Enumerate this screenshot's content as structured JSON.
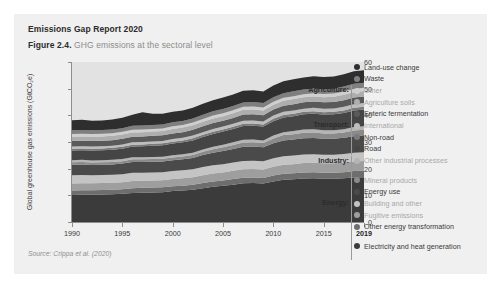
{
  "header": {
    "title": "Emissions Gap Report 2020",
    "figure_number": "Figure 2.4.",
    "caption": "GHG emissions at the sectoral level"
  },
  "source": "Source: Crippa et al. (2020)",
  "chart_data": {
    "type": "area",
    "title": "GHG emissions at the sectoral level",
    "xlabel": "",
    "ylabel": "Global greenhouse gas emissions (GtCO₂e)",
    "ylim": [
      0,
      60
    ],
    "xlim": [
      1990,
      2019
    ],
    "grid": false,
    "stacked": true,
    "legend_position": "right",
    "yticks": [
      "0",
      "10",
      "20",
      "30",
      "40",
      "50",
      "60"
    ],
    "xticks": [
      "1990",
      "1995",
      "2000",
      "2005",
      "2010",
      "2015",
      "2019"
    ],
    "xtick_emphasis": "2019",
    "x": [
      1990,
      1991,
      1992,
      1993,
      1994,
      1995,
      1996,
      1997,
      1998,
      1999,
      2000,
      2001,
      2002,
      2003,
      2004,
      2005,
      2006,
      2007,
      2008,
      2009,
      2010,
      2011,
      2012,
      2013,
      2014,
      2015,
      2016,
      2017,
      2018,
      2019
    ],
    "sectors": [
      {
        "name": "Energy",
        "series": [
          "Electricity and heat generation",
          "Other energy transformation",
          "Fugitive emissions",
          "Building and other"
        ]
      },
      {
        "name": "Industry",
        "series": [
          "Energy use",
          "Mineral products",
          "Other industrial processes"
        ]
      },
      {
        "name": "Transport",
        "series": [
          "Road",
          "Non-road",
          "International"
        ]
      },
      {
        "name": "Agriculture",
        "series": [
          "Enteric fermentation",
          "Agriculture soils",
          "Other"
        ]
      },
      {
        "name": "",
        "series": [
          "Waste",
          "Land-use change"
        ]
      }
    ],
    "series": [
      {
        "name": "Electricity and heat generation",
        "color": "#3b3b3b",
        "values": [
          10.1,
          10.2,
          10.2,
          10.3,
          10.4,
          10.6,
          10.9,
          11.0,
          11.1,
          11.2,
          11.6,
          11.8,
          12.1,
          12.7,
          13.2,
          13.6,
          14.0,
          14.5,
          14.6,
          14.4,
          15.2,
          15.8,
          16.0,
          16.3,
          16.4,
          16.2,
          16.2,
          16.4,
          16.7,
          16.8
        ]
      },
      {
        "name": "Other energy transformation",
        "color": "#6e6e6e",
        "values": [
          1.7,
          1.7,
          1.7,
          1.7,
          1.7,
          1.7,
          1.8,
          1.8,
          1.8,
          1.8,
          1.8,
          1.8,
          1.9,
          1.9,
          2.0,
          2.0,
          2.1,
          2.1,
          2.1,
          2.1,
          2.2,
          2.3,
          2.3,
          2.3,
          2.3,
          2.3,
          2.3,
          2.3,
          2.4,
          2.4
        ]
      },
      {
        "name": "Fugitive emissions",
        "color": "#9e9e9e",
        "values": [
          2.6,
          2.6,
          2.6,
          2.6,
          2.6,
          2.6,
          2.7,
          2.7,
          2.7,
          2.7,
          2.7,
          2.8,
          2.8,
          2.9,
          3.0,
          3.0,
          3.1,
          3.2,
          3.2,
          3.2,
          3.3,
          3.4,
          3.4,
          3.5,
          3.5,
          3.5,
          3.5,
          3.6,
          3.6,
          3.7
        ]
      },
      {
        "name": "Building and other",
        "color": "#c4c4c4",
        "values": [
          3.1,
          3.1,
          3.0,
          3.0,
          3.0,
          3.0,
          3.1,
          3.0,
          3.0,
          3.0,
          3.0,
          3.0,
          3.0,
          3.1,
          3.1,
          3.1,
          3.1,
          3.1,
          3.1,
          3.1,
          3.2,
          3.2,
          3.2,
          3.2,
          3.2,
          3.2,
          3.2,
          3.2,
          3.3,
          3.3
        ]
      },
      {
        "name": "Energy use",
        "color": "#4a4a4a",
        "values": [
          4.0,
          4.0,
          3.9,
          3.9,
          3.9,
          4.0,
          4.0,
          4.0,
          4.0,
          4.0,
          4.1,
          4.1,
          4.2,
          4.5,
          4.7,
          4.9,
          5.1,
          5.3,
          5.3,
          5.2,
          5.6,
          5.9,
          6.0,
          6.1,
          6.1,
          6.0,
          6.0,
          6.1,
          6.2,
          6.3
        ]
      },
      {
        "name": "Mineral products",
        "color": "#8a8a8a",
        "values": [
          0.9,
          0.9,
          0.9,
          0.9,
          0.9,
          0.9,
          1.0,
          1.0,
          1.0,
          1.0,
          1.0,
          1.1,
          1.1,
          1.2,
          1.3,
          1.4,
          1.5,
          1.6,
          1.6,
          1.6,
          1.8,
          2.0,
          2.0,
          2.1,
          2.1,
          2.0,
          2.0,
          2.0,
          2.1,
          2.1
        ]
      },
      {
        "name": "Other industrial processes",
        "color": "#b5b5b5",
        "values": [
          0.8,
          0.8,
          0.8,
          0.8,
          0.8,
          0.8,
          0.8,
          0.8,
          0.8,
          0.8,
          0.8,
          0.8,
          0.9,
          0.9,
          0.9,
          1.0,
          1.0,
          1.0,
          1.0,
          1.0,
          1.1,
          1.1,
          1.2,
          1.2,
          1.2,
          1.2,
          1.2,
          1.2,
          1.3,
          1.3
        ]
      },
      {
        "name": "Road",
        "color": "#454545",
        "values": [
          3.6,
          3.6,
          3.7,
          3.7,
          3.8,
          3.9,
          4.0,
          4.1,
          4.2,
          4.3,
          4.4,
          4.5,
          4.6,
          4.7,
          4.8,
          4.9,
          5.0,
          5.2,
          5.2,
          5.2,
          5.4,
          5.5,
          5.6,
          5.7,
          5.8,
          5.9,
          6.0,
          6.1,
          6.2,
          6.3
        ]
      },
      {
        "name": "Non-road",
        "color": "#7a7a7a",
        "values": [
          0.7,
          0.7,
          0.7,
          0.7,
          0.7,
          0.7,
          0.7,
          0.7,
          0.7,
          0.7,
          0.7,
          0.7,
          0.8,
          0.8,
          0.8,
          0.8,
          0.8,
          0.8,
          0.8,
          0.8,
          0.9,
          0.9,
          0.9,
          0.9,
          0.9,
          0.9,
          0.9,
          0.9,
          1.0,
          1.0
        ]
      },
      {
        "name": "International",
        "color": "#bdbdbd",
        "values": [
          0.8,
          0.8,
          0.8,
          0.8,
          0.8,
          0.9,
          0.9,
          0.9,
          0.9,
          0.9,
          1.0,
          1.0,
          1.0,
          1.0,
          1.1,
          1.1,
          1.1,
          1.2,
          1.2,
          1.1,
          1.2,
          1.2,
          1.2,
          1.2,
          1.3,
          1.3,
          1.3,
          1.4,
          1.4,
          1.4
        ]
      },
      {
        "name": "Enteric fermentation",
        "color": "#5a5a5a",
        "values": [
          2.1,
          2.1,
          2.1,
          2.1,
          2.1,
          2.1,
          2.1,
          2.1,
          2.1,
          2.1,
          2.1,
          2.1,
          2.2,
          2.2,
          2.2,
          2.2,
          2.2,
          2.3,
          2.3,
          2.3,
          2.3,
          2.3,
          2.4,
          2.4,
          2.4,
          2.4,
          2.4,
          2.5,
          2.5,
          2.5
        ]
      },
      {
        "name": "Agriculture soils",
        "color": "#aeaeae",
        "values": [
          1.6,
          1.6,
          1.6,
          1.6,
          1.6,
          1.6,
          1.6,
          1.6,
          1.6,
          1.6,
          1.7,
          1.7,
          1.7,
          1.7,
          1.7,
          1.7,
          1.8,
          1.8,
          1.8,
          1.8,
          1.8,
          1.9,
          1.9,
          1.9,
          1.9,
          1.9,
          2.0,
          2.0,
          2.0,
          2.0
        ]
      },
      {
        "name": "Other",
        "color": "#cfcfcf",
        "values": [
          1.0,
          1.0,
          1.0,
          1.0,
          1.0,
          1.0,
          1.0,
          1.0,
          1.0,
          1.0,
          1.0,
          1.0,
          1.0,
          1.0,
          1.1,
          1.1,
          1.1,
          1.1,
          1.1,
          1.1,
          1.1,
          1.1,
          1.1,
          1.1,
          1.2,
          1.2,
          1.2,
          1.2,
          1.2,
          1.2
        ]
      },
      {
        "name": "Waste",
        "color": "#7f7f7f",
        "values": [
          1.4,
          1.4,
          1.4,
          1.4,
          1.4,
          1.4,
          1.5,
          1.5,
          1.5,
          1.5,
          1.5,
          1.5,
          1.5,
          1.6,
          1.6,
          1.6,
          1.6,
          1.6,
          1.7,
          1.7,
          1.7,
          1.7,
          1.8,
          1.8,
          1.8,
          1.8,
          1.8,
          1.9,
          1.9,
          1.9
        ]
      },
      {
        "name": "Land-use change",
        "color": "#2e2e2e",
        "values": [
          3.8,
          3.8,
          3.6,
          3.6,
          3.7,
          3.9,
          4.1,
          5.0,
          4.2,
          4.0,
          3.9,
          3.9,
          4.0,
          4.1,
          4.2,
          4.3,
          4.3,
          4.4,
          4.4,
          4.3,
          4.4,
          4.5,
          4.5,
          4.5,
          4.6,
          4.6,
          4.6,
          4.6,
          4.7,
          4.7
        ]
      }
    ]
  },
  "legend": [
    {
      "label": "Land-use change",
      "color": "#2e2e2e",
      "dim": false
    },
    {
      "label": "Waste",
      "color": "#7f7f7f",
      "dim": false
    },
    {
      "label": "Other",
      "color": "#cfcfcf",
      "dim": true
    },
    {
      "label": "Agriculture soils",
      "color": "#aeaeae",
      "dim": true
    },
    {
      "label": "Enteric fermentation",
      "color": "#5a5a5a",
      "dim": false
    },
    {
      "label": "International",
      "color": "#bdbdbd",
      "dim": true
    },
    {
      "label": "Non-road",
      "color": "#7a7a7a",
      "dim": false
    },
    {
      "label": "Road",
      "color": "#454545",
      "dim": false
    },
    {
      "label": "Other industrial processes",
      "color": "#b5b5b5",
      "dim": true
    },
    {
      "label": "Mineral products",
      "color": "#8a8a8a",
      "dim": true
    },
    {
      "label": "Energy use",
      "color": "#4a4a4a",
      "dim": false
    },
    {
      "label": "Building and other",
      "color": "#c4c4c4",
      "dim": true
    },
    {
      "label": "Fugitive emissions",
      "color": "#9e9e9e",
      "dim": true
    },
    {
      "label": "Other energy transformation",
      "color": "#6e6e6e",
      "dim": false
    },
    {
      "label": "Electricity and heat generation",
      "color": "#3b3b3b",
      "dim": false
    }
  ],
  "sector_labels": [
    {
      "name": "Agriculture:",
      "start_index": 2,
      "end_index": 4
    },
    {
      "name": "Transport:",
      "start_index": 5,
      "end_index": 7
    },
    {
      "name": "Industry:",
      "start_index": 8,
      "end_index": 10
    },
    {
      "name": "Energy:",
      "start_index": 11,
      "end_index": 14
    }
  ]
}
